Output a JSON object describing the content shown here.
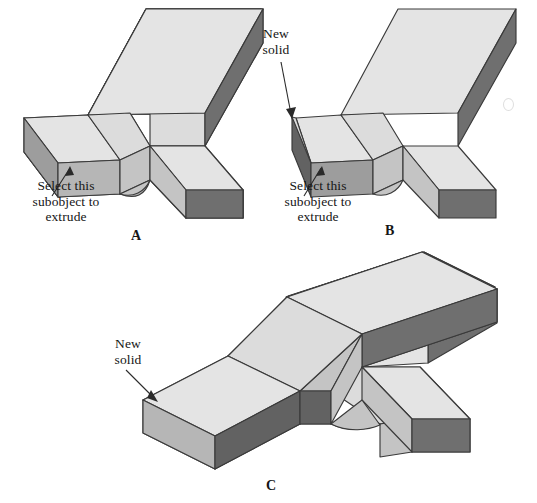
{
  "figure": {
    "background_color": "#ffffff",
    "line_color": "#3a3a3a",
    "palette": {
      "top_light": "#dcdcdc",
      "top_lighter": "#e6e6e6",
      "side_mid": "#b4b4b4",
      "side_mid_2": "#c2c2c2",
      "side_dark": "#6f6f6f",
      "side_darker": "#5f5f5f",
      "face_select": "#9a9a9a"
    },
    "panels": [
      {
        "id": "A",
        "letter": "A",
        "callouts": [
          {
            "id": "a-select",
            "text": "Select this\nsubobject to\nextrude",
            "align": "center",
            "arrow_from": [
              52,
              196
            ],
            "arrow_to": [
              70,
              166
            ]
          }
        ]
      },
      {
        "id": "B",
        "letter": "B",
        "callouts": [
          {
            "id": "b-new",
            "text": "New\nsolid",
            "align": "center",
            "arrow_from": [
              281,
              60
            ],
            "arrow_to": [
              292,
              117
            ]
          },
          {
            "id": "b-select",
            "text": "Select this\nsubobject to\nextrude",
            "align": "center",
            "arrow_from": [
              304,
              196
            ],
            "arrow_to": [
              321,
              166
            ]
          }
        ]
      },
      {
        "id": "C",
        "letter": "C",
        "callouts": [
          {
            "id": "c-new",
            "text": "New\nsolid",
            "align": "center",
            "arrow_from": [
              126,
              370
            ],
            "arrow_to": [
              157,
              401
            ]
          }
        ]
      }
    ]
  }
}
